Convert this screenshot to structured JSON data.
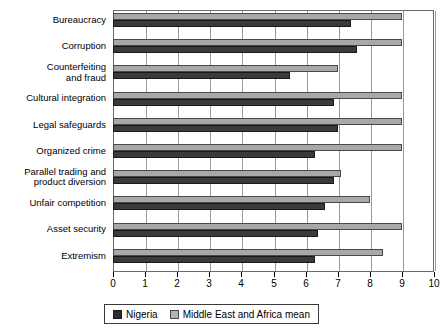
{
  "chart_data": {
    "type": "bar",
    "orientation": "horizontal",
    "title": "",
    "xlabel": "",
    "ylabel": "",
    "xlim": [
      0,
      10
    ],
    "xticks": [
      0,
      1,
      2,
      3,
      4,
      5,
      6,
      7,
      8,
      9,
      10
    ],
    "grid": true,
    "legend_position": "bottom",
    "categories": [
      "Bureaucracy",
      "Corruption",
      "Counterfeiting and fraud",
      "Cultural integration",
      "Legal safeguards",
      "Organized crime",
      "Parallel trading and product diversion",
      "Unfair competition",
      "Asset security",
      "Extremism"
    ],
    "category_lines": [
      [
        "Bureaucracy"
      ],
      [
        "Corruption"
      ],
      [
        "Counterfeiting",
        "and fraud"
      ],
      [
        "Cultural integration"
      ],
      [
        "Legal safeguards"
      ],
      [
        "Organized crime"
      ],
      [
        "Parallel trading and",
        "product diversion"
      ],
      [
        "Unfair competition"
      ],
      [
        "Asset security"
      ],
      [
        "Extremism"
      ]
    ],
    "series": [
      {
        "name": "Nigeria",
        "color": "#3a3a3a",
        "values": [
          7.4,
          7.6,
          5.5,
          6.9,
          7.0,
          6.3,
          6.9,
          6.6,
          6.4,
          6.3
        ]
      },
      {
        "name": "Middle East and Africa mean",
        "color": "#a8a8a8",
        "values": [
          9.0,
          9.0,
          7.0,
          9.0,
          9.0,
          9.0,
          7.1,
          8.0,
          9.0,
          8.4
        ]
      }
    ]
  },
  "legend": {
    "entries": [
      {
        "label": "Nigeria",
        "color": "#2e2e2e"
      },
      {
        "label": "Middle East and Africa mean",
        "color": "#b4b4b4"
      }
    ]
  },
  "axis": {
    "tick_labels": [
      "0",
      "1",
      "2",
      "3",
      "4",
      "5",
      "6",
      "7",
      "8",
      "9",
      "10"
    ]
  }
}
